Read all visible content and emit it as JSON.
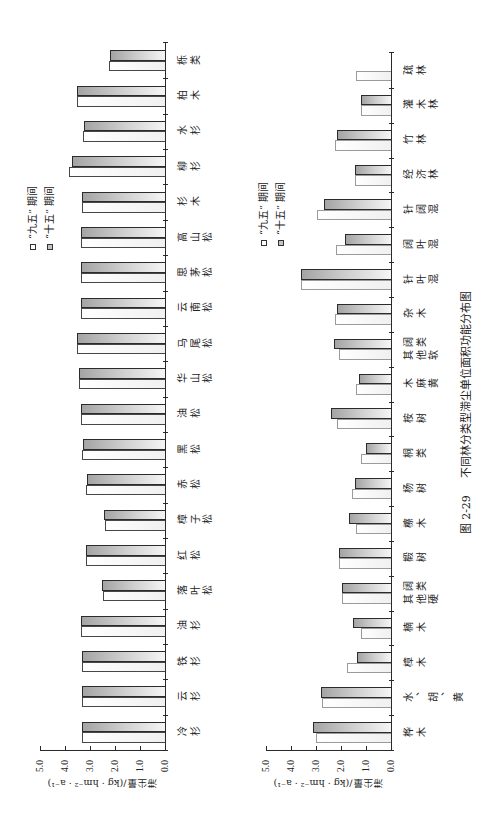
{
  "figure": {
    "number": "图 2-29",
    "title": "不同林分类型滞尘单位面积功能分布图"
  },
  "chart_data": [
    {
      "type": "bar",
      "title": "",
      "xlabel": "",
      "ylabel": "滞尘量/(kg · hm⁻² · a⁻¹)",
      "ylim": [
        0,
        5
      ],
      "yticks": [
        "0.0",
        "1.0",
        "2.0",
        "3.0",
        "4.0",
        "5.0"
      ],
      "grid": false,
      "legend_position": "upper right",
      "categories": [
        "冷杉",
        "云杉",
        "铁杉",
        "油杉",
        "落叶松",
        "红松",
        "樟子松",
        "赤松",
        "黑松",
        "油松",
        "华山松",
        "马尾松",
        "云南松",
        "思茅松",
        "高山松",
        "杉木",
        "柳杉",
        "水杉",
        "柏木",
        "栎类"
      ],
      "series": [
        {
          "key": "jiuwu",
          "name": "“九五” 期间",
          "color": "#ffffff",
          "values": [
            3.31,
            3.32,
            3.33,
            3.35,
            2.48,
            3.16,
            2.4,
            3.15,
            3.31,
            3.37,
            3.43,
            3.53,
            3.37,
            3.37,
            3.37,
            3.31,
            3.83,
            3.27,
            3.53,
            2.23
          ]
        },
        {
          "key": "shiwu",
          "name": "“十五” 期间",
          "color": "#a4a4a4",
          "values": [
            3.31,
            3.33,
            3.33,
            3.35,
            2.53,
            3.16,
            2.43,
            3.11,
            3.27,
            3.37,
            3.43,
            3.53,
            3.37,
            3.37,
            3.37,
            3.31,
            3.72,
            3.23,
            3.51,
            2.2
          ]
        }
      ]
    },
    {
      "type": "bar",
      "title": "",
      "xlabel": "",
      "ylabel": "滞尘量/(kg · hm⁻² · a⁻¹)",
      "ylim": [
        0,
        5
      ],
      "yticks": [
        "0.0",
        "1.0",
        "2.0",
        "3.0",
        "4.0",
        "5.0"
      ],
      "grid": false,
      "legend_position": "upper right",
      "categories": [
        "桦木",
        "水、胡、黄",
        "樟木",
        "楠木",
        "其他硬阔类",
        "椴树",
        "檫木",
        "杨树",
        "桐类",
        "桉树",
        "木麻黄",
        "其他软阔类",
        "杂木",
        "针叶混",
        "阔叶混",
        "针阔混",
        "经济林",
        "竹林",
        "灌木林",
        "疏林"
      ],
      "series": [
        {
          "key": "jiuwu",
          "name": "“九五” 期间",
          "color": "#ffffff",
          "values": [
            3.02,
            2.77,
            1.75,
            1.19,
            1.96,
            2.08,
            1.42,
            1.58,
            1.19,
            2.17,
            1.42,
            2.09,
            2.25,
            3.6,
            2.2,
            2.96,
            1.46,
            2.25,
            1.2,
            1.42
          ]
        },
        {
          "key": "shiwu",
          "name": "“十五” 期间",
          "color": "#a4a4a4",
          "values": [
            3.13,
            2.81,
            1.37,
            1.54,
            1.95,
            2.07,
            1.7,
            1.46,
            1.01,
            2.4,
            1.3,
            2.3,
            2.17,
            3.6,
            1.86,
            2.69,
            1.46,
            2.17,
            1.2,
            null
          ]
        }
      ]
    }
  ]
}
